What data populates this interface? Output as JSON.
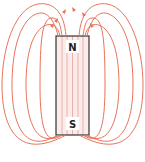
{
  "diagram": {
    "colors": {
      "field_line": "#e8735a",
      "magnet_fill": "#fbeceb",
      "magnet_inner_line": "#eab0aa",
      "magnet_border": "#333333",
      "background": "#ffffff"
    },
    "magnet": {
      "north_label": "N",
      "south_label": "S"
    },
    "field_lines_count": 8,
    "arrow_direction": "out of north pole, curving toward south"
  }
}
